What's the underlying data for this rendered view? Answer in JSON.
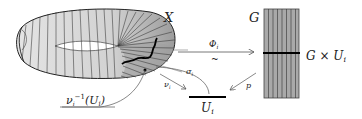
{
  "diagram": {
    "type": "fiber-bundle-local-trivialization",
    "labels": {
      "total_space": "X",
      "fiber": "G",
      "trivialization_map": "Φ",
      "trivialization_map_sub": "i",
      "iso_symbol": "~",
      "product": "G × U",
      "product_sub": "i",
      "section": "σ",
      "section_sub": "i",
      "projection_product": "p",
      "projection_bundle": "ν",
      "projection_bundle_sub": "i",
      "base_open_set": "U",
      "base_open_set_sub": "i",
      "preimage": "ν",
      "preimage_sub": "i",
      "preimage_sup": "−1",
      "preimage_arg": "(U",
      "preimage_arg_sub": "i",
      "preimage_close": ")"
    },
    "colors": {
      "band_light": "#d9d9d9",
      "band_dark": "#a8a8a8",
      "rect_fill": "#a9a9a9",
      "stroke": "#222222",
      "arrow": "#555555"
    }
  }
}
